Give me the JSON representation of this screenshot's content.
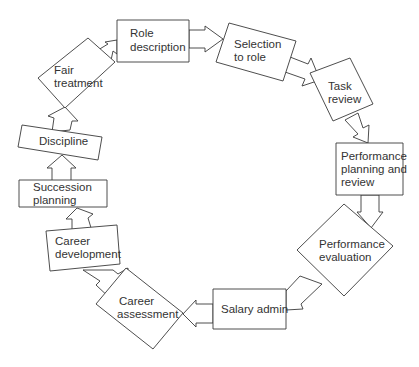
{
  "diagram": {
    "type": "cycle-flow",
    "nodes": [
      {
        "id": "role",
        "lines": [
          "Role",
          "description"
        ]
      },
      {
        "id": "selection",
        "lines": [
          "Selection",
          "to role"
        ]
      },
      {
        "id": "task",
        "lines": [
          "Task",
          "review"
        ]
      },
      {
        "id": "perfplan",
        "lines": [
          "Performance",
          "planning and",
          "review"
        ]
      },
      {
        "id": "perfeval",
        "lines": [
          "Performance",
          "evaluation"
        ]
      },
      {
        "id": "salary",
        "lines": [
          "Salary admin"
        ]
      },
      {
        "id": "careerassess",
        "lines": [
          "Career",
          "assessment"
        ]
      },
      {
        "id": "careerdev",
        "lines": [
          "Career",
          "development"
        ]
      },
      {
        "id": "succession",
        "lines": [
          "Succession",
          "planning"
        ]
      },
      {
        "id": "discipline",
        "lines": [
          "Discipline"
        ]
      },
      {
        "id": "fair",
        "lines": [
          "Fair",
          "treatment"
        ]
      }
    ],
    "edges": [
      [
        "role",
        "selection"
      ],
      [
        "selection",
        "task"
      ],
      [
        "task",
        "perfplan"
      ],
      [
        "perfplan",
        "perfeval"
      ],
      [
        "perfeval",
        "salary"
      ],
      [
        "salary",
        "careerassess"
      ],
      [
        "careerassess",
        "careerdev"
      ],
      [
        "careerdev",
        "succession"
      ],
      [
        "succession",
        "discipline"
      ],
      [
        "discipline",
        "fair"
      ],
      [
        "fair",
        "role"
      ]
    ],
    "colors": {
      "stroke": "#3a3a3a",
      "fill": "#ffffff",
      "text": "#333333"
    }
  }
}
